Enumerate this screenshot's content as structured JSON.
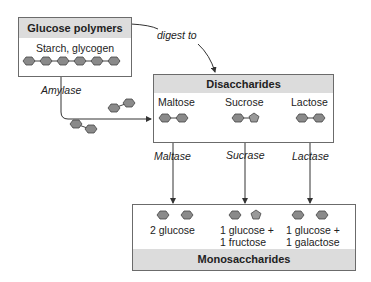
{
  "polymer_box": {
    "title": "Glucose polymers",
    "subtitle": "Starch, glycogen"
  },
  "labels": {
    "digest_to": "digest to",
    "amylase": "Amylase"
  },
  "disaccharide_box": {
    "title": "Disaccharides",
    "items": [
      {
        "name": "Maltose",
        "enzyme": "Maltase"
      },
      {
        "name": "Sucrose",
        "enzyme": "Sucrase"
      },
      {
        "name": "Lactose",
        "enzyme": "Lactase"
      }
    ]
  },
  "monosaccharide_box": {
    "title": "Monosaccharides",
    "products": [
      {
        "line1": "2 glucose",
        "line2": ""
      },
      {
        "line1": "1 glucose +",
        "line2": "1 fructose"
      },
      {
        "line1": "1 glucose +",
        "line2": "1 galactose"
      }
    ]
  },
  "colors": {
    "hexagon_fill": "#8a8a8a",
    "header_fill": "#dcdcdc",
    "border": "#6b6b6b"
  }
}
